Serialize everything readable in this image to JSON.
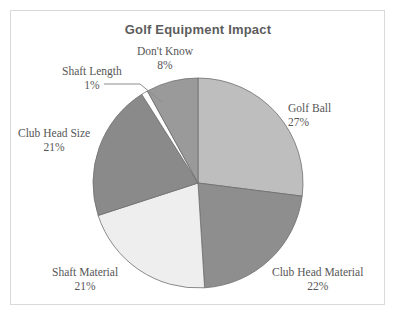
{
  "chart": {
    "title": "Golf Equipment Impact",
    "frame_color": "#d9d9d9",
    "background": "#ffffff",
    "title_color": "#5c5c5c",
    "label_color": "#565656"
  },
  "chart_data": {
    "type": "pie",
    "title": "Golf Equipment Impact",
    "xlabel": "",
    "ylabel": "",
    "legend": "none",
    "grid": false,
    "start_angle_deg": 0,
    "direction": "clockwise",
    "categories": [
      "Golf Ball",
      "Club Head Material",
      "Shaft Material",
      "Club Head Size",
      "Shaft Length",
      "Don't Know"
    ],
    "values": [
      27,
      22,
      21,
      21,
      1,
      8
    ],
    "value_unit": "%",
    "slices": [
      {
        "label": "Golf Ball",
        "percent": 27,
        "percent_text": "27%",
        "color": "#bebebe"
      },
      {
        "label": "Club Head Material",
        "percent": 22,
        "percent_text": "22%",
        "color": "#8e8e8e"
      },
      {
        "label": "Shaft Material",
        "percent": 21,
        "percent_text": "21%",
        "color": "#eeeeee"
      },
      {
        "label": "Club Head Size",
        "percent": 21,
        "percent_text": "21%",
        "color": "#8a8a8a"
      },
      {
        "label": "Shaft Length",
        "percent": 1,
        "percent_text": "1%",
        "color": "#ffffff"
      },
      {
        "label": "Don't Know",
        "percent": 8,
        "percent_text": "8%",
        "color": "#9a9a9a"
      }
    ]
  },
  "labels": {
    "golf_ball": {
      "name": "Golf Ball",
      "percent": "27%"
    },
    "club_head_material": {
      "name": "Club Head Material",
      "percent": "22%"
    },
    "shaft_material": {
      "name": "Shaft Material",
      "percent": "21%"
    },
    "club_head_size": {
      "name": "Club Head Size",
      "percent": "21%"
    },
    "shaft_length": {
      "name": "Shaft Length",
      "percent": "1%"
    },
    "dont_know": {
      "name": "Don't Know",
      "percent": "8%"
    }
  }
}
